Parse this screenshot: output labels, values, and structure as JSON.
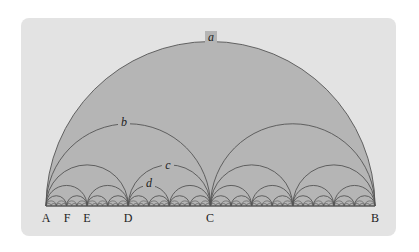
{
  "figure": {
    "baseline_points": [
      {
        "label": "A",
        "x": 46
      },
      {
        "label": "F",
        "x": 67
      },
      {
        "label": "E",
        "x": 87
      },
      {
        "label": "D",
        "x": 128
      },
      {
        "label": "C",
        "x": 210
      },
      {
        "label": "B",
        "x": 375
      }
    ],
    "arc_labels": [
      {
        "label": "a",
        "x": 211,
        "y": 41
      },
      {
        "label": "b",
        "x": 124,
        "y": 126
      },
      {
        "label": "c",
        "x": 168,
        "y": 169
      },
      {
        "label": "d",
        "x": 149,
        "y": 187
      }
    ],
    "subdivision_levels": 6,
    "colors": {
      "page": "#ffffff",
      "panel": "#e3e3e3",
      "fill": "#b5b5b5",
      "stroke": "#555555",
      "text": "#222222"
    }
  }
}
